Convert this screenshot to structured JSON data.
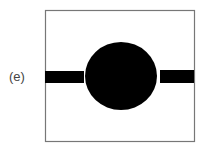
{
  "panel": {
    "label": "(e)",
    "frame": {
      "x": 45,
      "y": 10,
      "width": 149,
      "height": 131,
      "stroke": "#777777"
    },
    "circle": {
      "cx": 121,
      "cy": 76,
      "rx": 36,
      "ry": 34,
      "fill": "#000000"
    },
    "left_bar": {
      "x": 45,
      "y": 71,
      "width": 39,
      "height": 12,
      "fill": "#000000"
    },
    "right_bar": {
      "x": 160,
      "y": 70,
      "width": 34,
      "height": 13,
      "fill": "#000000"
    }
  }
}
